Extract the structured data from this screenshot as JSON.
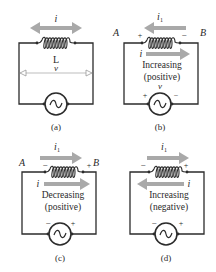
{
  "figure": {
    "panels": [
      {
        "id": "a",
        "caption": "(a)",
        "current_label": "i",
        "current_direction": "both",
        "inductor_label": "L",
        "voltage_label": "v"
      },
      {
        "id": "b",
        "caption": "(b)",
        "node_left": "A",
        "node_right": "B",
        "induced_current_label": "i",
        "induced_current_sub": "1",
        "induced_current_direction": "left",
        "current_label": "i",
        "current_direction": "right",
        "inductor_polarity_left": "+",
        "inductor_polarity_right": "−",
        "state_line1": "Increasing",
        "state_line2": "(positive)",
        "voltage_label": "v",
        "source_polarity_left": "+",
        "source_polarity_right": "−"
      },
      {
        "id": "c",
        "caption": "(c)",
        "node_left": "A",
        "node_right": "B",
        "induced_current_label": "i",
        "induced_current_sub": "1",
        "induced_current_direction": "right",
        "current_label": "i",
        "current_direction": "right",
        "inductor_polarity_left": "−",
        "inductor_polarity_right": "+",
        "state_line1": "Decreasing",
        "state_line2": "(positive)",
        "source_polarity_left": "−",
        "source_polarity_right": "+"
      },
      {
        "id": "d",
        "caption": "(d)",
        "induced_current_label": "i",
        "induced_current_sub": "1",
        "induced_current_direction": "right",
        "current_label": "i",
        "current_direction": "left",
        "inductor_polarity_left": "−",
        "inductor_polarity_right": "+",
        "state_line1": "Increasing",
        "state_line2": "(negative)",
        "source_polarity_left": "−",
        "source_polarity_right": "+"
      }
    ],
    "colors": {
      "wire": "#2b2b2b",
      "arrow": "#a9a9a9",
      "text": "#2a2a2a"
    }
  }
}
